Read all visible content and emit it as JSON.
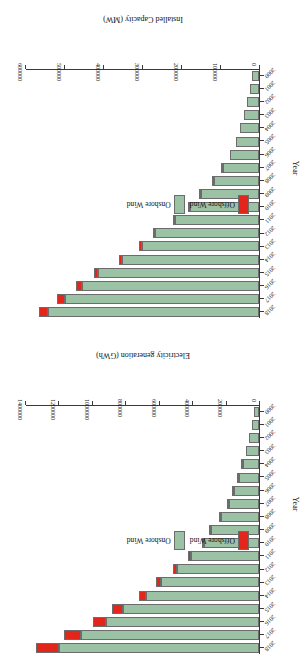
{
  "figure": {
    "rotation_degrees": 180,
    "colors": {
      "offshore": "#e3261b",
      "onshore": "#9cc2a6",
      "axis": "#3a3a3a",
      "background": "#ffffff"
    }
  },
  "chart_data": [
    {
      "id": "generation",
      "type": "bar",
      "orientation": "horizontal",
      "stacked": true,
      "title": "",
      "xlabel": "Electricity generation (GWh)",
      "ylabel": "Year",
      "xlim": [
        0,
        1400000
      ],
      "xticks": [
        0,
        200000,
        400000,
        600000,
        800000,
        1000000,
        1200000,
        1400000
      ],
      "xtick_labels": [
        "0",
        "200000",
        "400000",
        "600000",
        "800000",
        "1000000",
        "1200000",
        "1400000"
      ],
      "grid": false,
      "legend_position": "center-left",
      "categories": [
        "2000",
        "2001",
        "2002",
        "2003",
        "2004",
        "2005",
        "2006",
        "2007",
        "2008",
        "2009",
        "2010",
        "2011",
        "2012",
        "2013",
        "2014",
        "2015",
        "2016",
        "2017",
        "2018"
      ],
      "series": [
        {
          "name": "Onshore Wind",
          "color": "#9cc2a6",
          "values": [
            31000,
            44000,
            60000,
            78000,
            98000,
            122000,
            150000,
            179000,
            226000,
            285000,
            329000,
            409000,
            491000,
            584000,
            675000,
            814000,
            913000,
            1063000,
            1198000
          ]
        },
        {
          "name": "Offshore Wind",
          "color": "#e3261b",
          "values": [
            0,
            0,
            0,
            0,
            1000,
            1000,
            2000,
            3000,
            4000,
            6000,
            10000,
            16000,
            24000,
            33000,
            45000,
            64000,
            83000,
            106000,
            136000
          ]
        }
      ]
    },
    {
      "id": "capacity",
      "type": "bar",
      "orientation": "horizontal",
      "stacked": true,
      "title": "",
      "xlabel": "Installed Capacity (MW)",
      "ylabel": "Year",
      "xlim": [
        0,
        600000
      ],
      "xticks": [
        0,
        100000,
        200000,
        300000,
        400000,
        500000,
        600000
      ],
      "xtick_labels": [
        "0",
        "100000",
        "200000",
        "300000",
        "400000",
        "500000",
        "600000"
      ],
      "grid": false,
      "legend_position": "center-left",
      "categories": [
        "2000",
        "2001",
        "2002",
        "2003",
        "2004",
        "2005",
        "2006",
        "2007",
        "2008",
        "2009",
        "2010",
        "2011",
        "2012",
        "2013",
        "2014",
        "2015",
        "2016",
        "2017",
        "2018"
      ],
      "series": [
        {
          "name": "Onshore Wind",
          "color": "#9cc2a6",
          "values": [
            16900,
            23400,
            30900,
            39400,
            47600,
            58800,
            73200,
            92000,
            114500,
            149000,
            178000,
            215000,
            266000,
            300000,
            350000,
            412000,
            455000,
            498000,
            542000
          ]
        },
        {
          "name": "Offshore Wind",
          "color": "#e3261b",
          "values": [
            0,
            0,
            0,
            0,
            0,
            0,
            0,
            1100,
            1500,
            2100,
            3100,
            4100,
            5400,
            7000,
            8800,
            12100,
            14400,
            18700,
            23100
          ]
        }
      ]
    }
  ],
  "legend": {
    "items": [
      {
        "label": "Offshore Wind",
        "swatch": "offshore"
      },
      {
        "label": "Onshore Wind",
        "swatch": "onshore"
      }
    ]
  }
}
